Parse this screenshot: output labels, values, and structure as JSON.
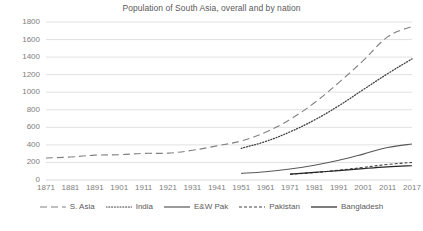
{
  "chart_data": {
    "type": "line",
    "title": "Population of South Asia, overall and by nation",
    "xlabel": "",
    "ylabel": "",
    "grid": true,
    "legend_position": "bottom",
    "ylim": [
      0,
      1800
    ],
    "yticks": [
      0,
      200,
      400,
      600,
      800,
      1000,
      1200,
      1400,
      1600,
      1800
    ],
    "categories": [
      "1871",
      "1881",
      "1891",
      "1901",
      "1911",
      "1921",
      "1931",
      "1941",
      "1951",
      "1961",
      "1971",
      "1981",
      "1991",
      "2001",
      "2011",
      "2017"
    ],
    "series": [
      {
        "name": "S. Asia",
        "style": "long-dash",
        "color": "#808080",
        "values": [
          250,
          262,
          283,
          288,
          303,
          306,
          338,
          389,
          445,
          545,
          690,
          880,
          1110,
          1360,
          1630,
          1750
        ]
      },
      {
        "name": "India",
        "style": "dotted",
        "color": "#404040",
        "values": [
          null,
          null,
          null,
          null,
          null,
          null,
          null,
          null,
          361,
          439,
          548,
          683,
          846,
          1029,
          1211,
          1380
        ]
      },
      {
        "name": "E&W Pak",
        "style": "solid",
        "color": "#595959",
        "values": [
          null,
          null,
          null,
          null,
          null,
          null,
          null,
          null,
          76,
          94,
          125,
          168,
          225,
          295,
          370,
          410
        ]
      },
      {
        "name": "Pakistan",
        "style": "short-dash",
        "color": "#404040",
        "values": [
          null,
          null,
          null,
          null,
          null,
          null,
          null,
          null,
          null,
          null,
          65,
          84,
          112,
          143,
          177,
          200
        ]
      },
      {
        "name": "Bangladesh",
        "style": "solid",
        "color": "#262626",
        "values": [
          null,
          null,
          null,
          null,
          null,
          null,
          null,
          null,
          null,
          null,
          67,
          87,
          107,
          130,
          150,
          163
        ]
      }
    ]
  },
  "legend": {
    "items": [
      {
        "label": "S. Asia"
      },
      {
        "label": "India"
      },
      {
        "label": "E&W Pak"
      },
      {
        "label": "Pakistan"
      },
      {
        "label": "Bangladesh"
      }
    ]
  },
  "colors": {
    "gridline": "#d9d9d9",
    "axis_text": "#808080",
    "title_text": "#595959",
    "background": "#ffffff"
  }
}
